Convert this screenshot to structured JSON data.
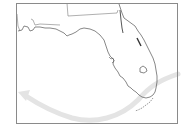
{
  "map": {
    "subject": "Florida",
    "frame": {
      "x": 16,
      "y": 3,
      "width": 162,
      "height": 121,
      "stroke": "#8a8a8a"
    },
    "colors": {
      "background": "#ffffff",
      "coastline": "#555555",
      "state_border": "#777777",
      "track_arrow": "#e3e3e3"
    },
    "features": [
      {
        "name": "Florida peninsula coastline"
      },
      {
        "name": "Georgia/Alabama state borders"
      },
      {
        "name": "Lake Okeechobee"
      },
      {
        "name": "Florida Keys"
      },
      {
        "name": "Storm track arrow",
        "direction": "east-to-west, curving north"
      }
    ]
  }
}
